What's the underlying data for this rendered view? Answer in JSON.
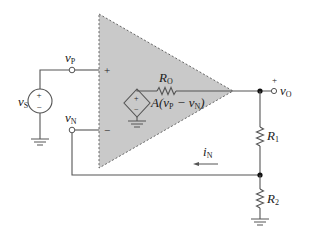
{
  "diagram": {
    "colors": {
      "background": "#ffffff",
      "opamp_fill": "#c9c9c9",
      "wire": "#555555",
      "text": "#222222"
    },
    "labels": {
      "vs": {
        "main": "v",
        "sub": "S"
      },
      "vp": {
        "main": "v",
        "sub": "P"
      },
      "vn": {
        "main": "v",
        "sub": "N"
      },
      "vo": {
        "main": "v",
        "sub": "O"
      },
      "ro": {
        "main": "R",
        "sub": "O"
      },
      "r1": {
        "main": "R",
        "sub": "1"
      },
      "r2": {
        "main": "R",
        "sub": "2"
      },
      "in": {
        "main": "i",
        "sub": "N"
      },
      "dep_source": {
        "prefix": "A(v",
        "p_sub": "P",
        "minus": " − v",
        "n_sub": "N",
        "suffix": ")"
      },
      "plus_input": "+",
      "minus_input": "−",
      "vo_plus": "+",
      "source_plus": "+",
      "source_minus": "−",
      "dep_plus": "+",
      "dep_minus": "−"
    },
    "components": [
      {
        "type": "voltage-source",
        "id": "vS"
      },
      {
        "type": "op-amp-model",
        "id": "opamp"
      },
      {
        "type": "resistor",
        "id": "RO"
      },
      {
        "type": "dependent-voltage-source",
        "id": "A(vP-vN)"
      },
      {
        "type": "resistor",
        "id": "R1"
      },
      {
        "type": "resistor",
        "id": "R2"
      },
      {
        "type": "current-arrow",
        "id": "iN",
        "direction": "left"
      }
    ]
  }
}
